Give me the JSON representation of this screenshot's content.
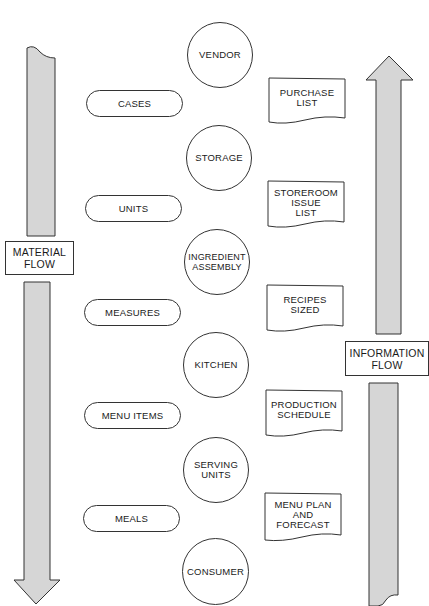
{
  "diagram": {
    "left_flow": {
      "label": "MATERIAL\nFLOW",
      "direction": "down"
    },
    "right_flow": {
      "label": "INFORMATION\nFLOW",
      "direction": "up"
    },
    "stages": [
      {
        "label": "VENDOR"
      },
      {
        "label": "STORAGE"
      },
      {
        "label": "INGREDIENT\nASSEMBLY"
      },
      {
        "label": "KITCHEN"
      },
      {
        "label": "SERVING\nUNITS"
      },
      {
        "label": "CONSUMER"
      }
    ],
    "units": [
      {
        "label": "CASES"
      },
      {
        "label": "UNITS"
      },
      {
        "label": "MEASURES"
      },
      {
        "label": "MENU ITEMS"
      },
      {
        "label": "MEALS"
      }
    ],
    "documents": [
      {
        "label": "PURCHASE\nLIST"
      },
      {
        "label": "STOREROOM\nISSUE\nLIST"
      },
      {
        "label": "RECIPES\nSIZED"
      },
      {
        "label": "PRODUCTION\nSCHEDULE"
      },
      {
        "label": "MENU PLAN\nAND\nFORECAST"
      }
    ],
    "colors": {
      "arrow_fill": "#d6d6d6",
      "stroke": "#333333"
    }
  }
}
